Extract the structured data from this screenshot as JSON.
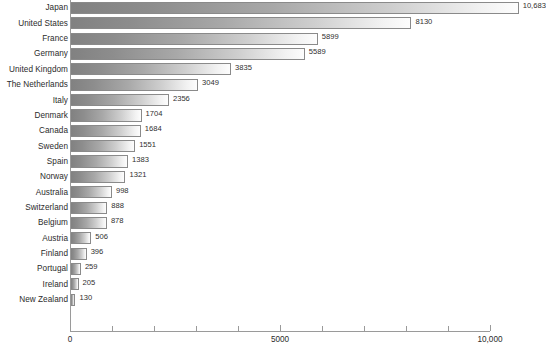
{
  "chart_data": {
    "type": "bar",
    "orientation": "horizontal",
    "title": "",
    "xlabel": "",
    "ylabel": "",
    "xlim": [
      0,
      10000
    ],
    "grid": false,
    "legend": null,
    "axis_tick_labels": [
      "0",
      "5000",
      "10,000"
    ],
    "axis_tick_values": [
      0,
      5000,
      10000
    ],
    "minor_tick_interval": 1000,
    "categories": [
      "Japan",
      "United States",
      "France",
      "Germany",
      "United Kingdom",
      "The Netherlands",
      "Italy",
      "Denmark",
      "Canada",
      "Sweden",
      "Spain",
      "Norway",
      "Australia",
      "Switzerland",
      "Belgium",
      "Austria",
      "Finland",
      "Portugal",
      "Ireland",
      "New Zealand"
    ],
    "values": [
      10683,
      8130,
      5899,
      5589,
      3835,
      3049,
      2356,
      1704,
      1684,
      1551,
      1383,
      1321,
      998,
      888,
      878,
      506,
      396,
      259,
      205,
      130
    ],
    "value_labels": [
      "10,683",
      "8130",
      "5899",
      "5589",
      "3835",
      "3049",
      "2356",
      "1704",
      "1684",
      "1551",
      "1383",
      "1321",
      "998",
      "888",
      "878",
      "506",
      "396",
      "259",
      "205",
      "130"
    ]
  },
  "style": {
    "bar_gradient_start": "#818181",
    "bar_gradient_end": "#fdfdfd",
    "bar_border": "#8a8a8a",
    "axis_color": "#9a9a9a",
    "text_color": "#2b2b2b",
    "background": "#ffffff"
  }
}
